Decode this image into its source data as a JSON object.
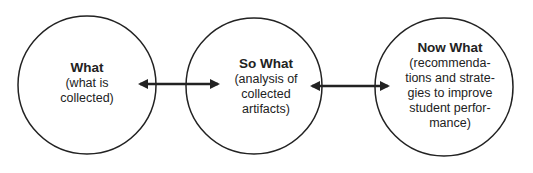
{
  "diagram": {
    "nodes": [
      {
        "id": "what",
        "title": "What",
        "description": "(what is\ncollected)"
      },
      {
        "id": "so-what",
        "title": "So What",
        "description": "(analysis of\ncollected\nartifacts)"
      },
      {
        "id": "now-what",
        "title": "Now What",
        "description": "(recommenda-\ntions and strate-\ngies to improve\nstudent perfor-\nmance)"
      }
    ],
    "edges": [
      {
        "from": "what",
        "to": "so-what",
        "type": "bidirectional-arrow"
      },
      {
        "from": "so-what",
        "to": "now-what",
        "type": "bidirectional-arrow"
      }
    ],
    "colors": {
      "stroke": "#222222",
      "text": "#222222",
      "background": "#ffffff"
    }
  }
}
